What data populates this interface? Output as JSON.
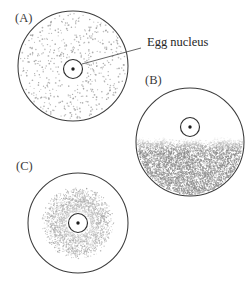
{
  "figure": {
    "background_color": "#ffffff",
    "outline_color": "#3c3c3c",
    "stipple_color": "#8d8d8d",
    "text_color": "#262626",
    "width": 250,
    "height": 286
  },
  "annotations": [
    {
      "id": "egg-nucleus-callout",
      "label": "Egg nucleus",
      "text_x": 147,
      "text_y": 46,
      "leader": {
        "x1": 141,
        "y1": 48,
        "x2": 82,
        "y2": 64
      }
    }
  ],
  "panels": [
    {
      "id": "panel-a",
      "label": "(A)",
      "label_x": 15,
      "label_y": 22,
      "cell": {
        "cx": 73,
        "cy": 66,
        "r": 55
      },
      "nucleus": {
        "cx": 73,
        "cy": 69,
        "r": 9.5
      },
      "nucleolus": {
        "cx": 73,
        "cy": 69,
        "r": 1.7
      },
      "stipple": {
        "pattern": "uniform-sparse",
        "description": "Determinants evenly dispersed throughout entire cytoplasm",
        "density": 0.18,
        "dot_color": "#9b9b9b"
      }
    },
    {
      "id": "panel-b",
      "label": "(B)",
      "label_x": 145,
      "label_y": 84,
      "cell": {
        "cx": 190,
        "cy": 142,
        "r": 54
      },
      "nucleus": {
        "cx": 190,
        "cy": 127,
        "r": 9.5
      },
      "nucleolus": {
        "cx": 190,
        "cy": 127,
        "r": 1.7
      },
      "stipple": {
        "pattern": "lower-hemisphere",
        "description": "Determinants localized to vegetal (lower) half of the egg",
        "boundary_y": 143,
        "density": 0.72,
        "dot_color": "#8a8a8a"
      }
    },
    {
      "id": "panel-c",
      "label": "(C)",
      "label_x": 16,
      "label_y": 170,
      "cell": {
        "cx": 78,
        "cy": 223,
        "r": 50
      },
      "nucleus": {
        "cx": 78,
        "cy": 223,
        "r": 9.5
      },
      "nucleolus": {
        "cx": 78,
        "cy": 223,
        "r": 1.7
      },
      "stipple": {
        "pattern": "radial-perinuclear",
        "description": "Determinants concentrated in a gradient around the egg nucleus",
        "inner_radius": 10,
        "outer_radius": 30,
        "density": 0.55,
        "dot_color": "#9a9a9a"
      }
    }
  ]
}
